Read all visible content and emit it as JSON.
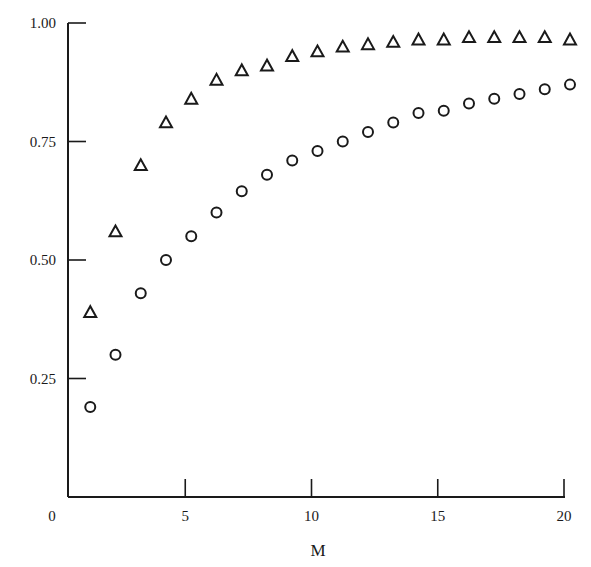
{
  "chart_data": {
    "type": "scatter",
    "title": "",
    "xlabel": "M",
    "ylabel": "",
    "xlim": [
      0,
      20
    ],
    "ylim": [
      0,
      1.0
    ],
    "grid": false,
    "legend": null,
    "x_ticks": [
      "0",
      "5",
      "10",
      "15",
      "20"
    ],
    "y_ticks": [
      "0.25",
      "0.50",
      "0.75",
      "1.00"
    ],
    "x": [
      1,
      2,
      3,
      4,
      5,
      6,
      7,
      8,
      9,
      10,
      11,
      12,
      13,
      14,
      15,
      16,
      17,
      18,
      19,
      20
    ],
    "series": [
      {
        "name": "triangles",
        "marker": "triangle",
        "values": [
          0.39,
          0.56,
          0.7,
          0.79,
          0.84,
          0.88,
          0.9,
          0.91,
          0.93,
          0.94,
          0.95,
          0.955,
          0.96,
          0.965,
          0.965,
          0.97,
          0.97,
          0.97,
          0.97,
          0.965
        ]
      },
      {
        "name": "circles",
        "marker": "circle",
        "values": [
          0.19,
          0.3,
          0.43,
          0.5,
          0.55,
          0.6,
          0.645,
          0.68,
          0.71,
          0.73,
          0.75,
          0.77,
          0.79,
          0.81,
          0.815,
          0.83,
          0.84,
          0.85,
          0.86,
          0.87
        ]
      }
    ]
  },
  "colors": {
    "ink": "#1a1a1a",
    "background": "#ffffff"
  }
}
